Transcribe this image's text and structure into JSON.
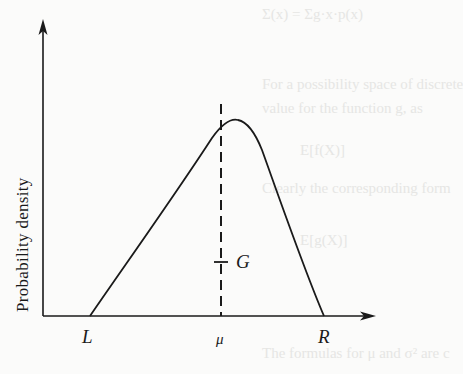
{
  "figure": {
    "y_axis_label": "Probability density",
    "x_axis_marks": {
      "left": "L",
      "mean": "μ",
      "right": "R"
    },
    "point_label": "G",
    "stroke_color": "#1a1a1a",
    "background_color": "#fbfbfa"
  },
  "background_bleed_text": [
    "Σ(x) = Σg·x·p(x)",
    "For a possibility space of discrete",
    "value for the function g, as",
    "E[f(X)]",
    "Clearly the corresponding form",
    "E[g(X)]",
    "The formulas for μ and σ² are c",
    "(ν − x) = μ respectively"
  ]
}
